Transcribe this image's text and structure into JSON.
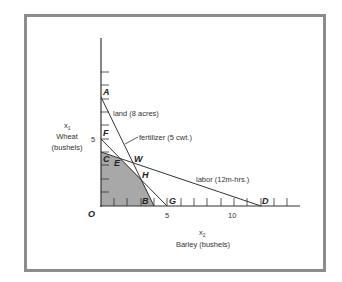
{
  "diagram": {
    "title": "",
    "y_axis": {
      "symbol": "x",
      "subscript": "1",
      "name": "Wheat",
      "unit": "(bushels)",
      "tick_label_5": "5"
    },
    "x_axis": {
      "symbol": "x",
      "subscript": "2",
      "name": "Barley (bushels)",
      "tick_label_5": "5",
      "tick_label_10": "10"
    },
    "origin_label": "O",
    "constraints": [
      {
        "name": "land",
        "label": "land (8 acres)",
        "intercept_x1": 8,
        "intercept_x2": 4
      },
      {
        "name": "fertilizer",
        "label": "fertilizer (5 cwt.)",
        "intercept_x1": 5,
        "intercept_x2": 5
      },
      {
        "name": "labor",
        "label": "labor (12m-hrs.)",
        "intercept_x1": 4,
        "intercept_x2": 12
      }
    ],
    "points": {
      "A": "A",
      "B": "B",
      "C": "C",
      "D": "D",
      "E": "E",
      "F": "F",
      "G": "G",
      "H": "H",
      "W": "W"
    },
    "feasible_region_color": "#a8a8a8",
    "line_color": "#333333",
    "frame_color": "#8c8c8c"
  }
}
